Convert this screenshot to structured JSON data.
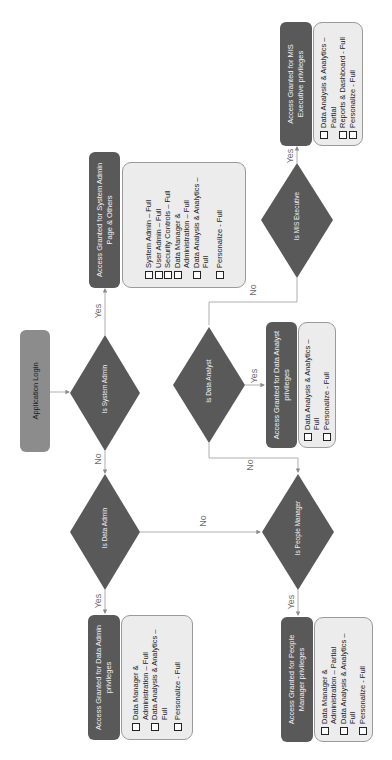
{
  "colors": {
    "decision_fill": "#595959",
    "header_fill": "#595959",
    "login_fill": "#8c8c8c",
    "body_fill": "#ececec",
    "connector": "#a6a6a6",
    "edge_label": "#6b6b6b"
  },
  "orientation": "rotated 90 degrees counter-clockwise",
  "start": {
    "label": "Application Login"
  },
  "decisions": {
    "system_admin": "Is System Admin",
    "data_admin": "Is Data Admin",
    "data_analyst": "Is Data Analyst",
    "people_manager": "Is People Manager",
    "mis_executive": "Is MIS Executive"
  },
  "outcomes": {
    "system_admin": {
      "title": "Access Granted for System Admin Page & Others",
      "items": [
        "System Admin – Full",
        "User Admin – Full",
        "Security Controls – Full",
        "Data Manager & Administration – Full",
        "Data Analysis & Analytics – Full",
        "Personalize - Full"
      ]
    },
    "mis_executive": {
      "title": "Access Granted for MIS Executive privileges",
      "items": [
        "Data Analysis & Analytics – Partial",
        "Reports & Dashboard - Full",
        "Personalize - Full"
      ]
    },
    "data_analyst": {
      "title": "Access Granted for Data Analyst privileges",
      "items": [
        "Data Analysis & Analytics – Full",
        "Personalize - Full"
      ]
    },
    "data_admin": {
      "title": "Access Granted for Data Admin privileges",
      "items": [
        "Data Manager & Administration – Full",
        "Data Analysis & Analytics – Full",
        "Personalize - Full"
      ]
    },
    "people_manager": {
      "title": "Access Granted for People Manager privileges",
      "items": [
        "Data Manager & Administration – Partial",
        "Data Analysis & Analytics – Full",
        "Personalize - Full"
      ]
    }
  },
  "edges": {
    "yes": "Yes",
    "no": "No"
  }
}
